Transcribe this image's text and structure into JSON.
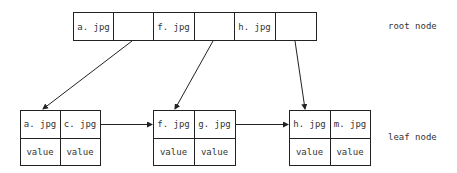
{
  "root": {
    "label": "root node",
    "keys": [
      "a. jpg",
      "",
      "f. jpg",
      "",
      "h. jpg",
      ""
    ]
  },
  "leaves": [
    {
      "keys": [
        "a. jpg",
        "c. jpg"
      ],
      "values": [
        "value",
        "value"
      ]
    },
    {
      "keys": [
        "f. jpg",
        "g. jpg"
      ],
      "values": [
        "value",
        "value"
      ]
    },
    {
      "keys": [
        "h. jpg",
        "m. jpg"
      ],
      "values": [
        "value",
        "value"
      ]
    }
  ],
  "leaf_label": "leaf node"
}
